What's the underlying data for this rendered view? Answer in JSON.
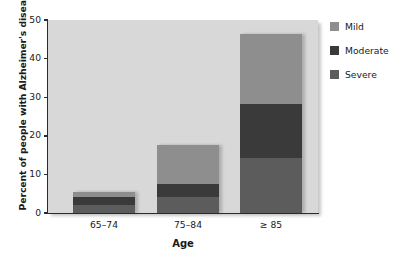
{
  "chart_data": {
    "type": "bar",
    "subtype": "stacked-bar",
    "title": "",
    "xlabel": "Age",
    "ylabel": "Percent of people with Alzheimer's disease",
    "categories": [
      "65–74",
      "75–84",
      "≥ 85"
    ],
    "series": [
      {
        "name": "Severe",
        "values": [
          2.0,
          4.2,
          14.2
        ],
        "color": "#5c5c5c"
      },
      {
        "name": "Moderate",
        "values": [
          2.2,
          3.4,
          14.1
        ],
        "color": "#3a3a3a"
      },
      {
        "name": "Mild",
        "values": [
          1.3,
          10.1,
          18.2
        ],
        "color": "#8e8e8e"
      }
    ],
    "totals": [
      5.5,
      17.7,
      46.5
    ],
    "ylim": [
      0,
      50
    ],
    "yticks": [
      0,
      10,
      20,
      30,
      40,
      50
    ],
    "ytick_labels": [
      "0",
      "10",
      "20",
      "30",
      "40",
      "50"
    ],
    "grid": false,
    "legend_position": "right",
    "plot_background": "#d8d8d8",
    "axis_color": "#2b2b2b",
    "text_color": "#1a1a1a"
  },
  "legend": {
    "items": [
      {
        "label": "Mild",
        "color": "#8e8e8e"
      },
      {
        "label": "Moderate",
        "color": "#3a3a3a"
      },
      {
        "label": "Severe",
        "color": "#5c5c5c"
      }
    ]
  }
}
